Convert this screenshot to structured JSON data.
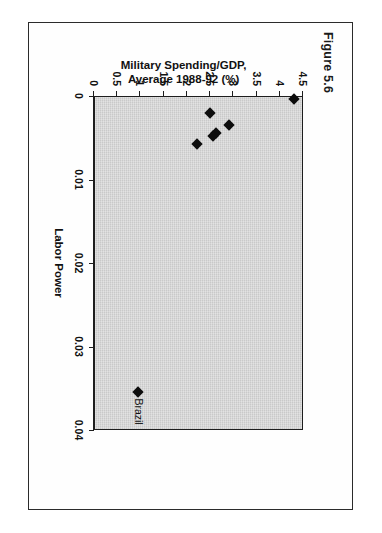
{
  "figure": {
    "caption": "Figure 5.6",
    "title": "South America"
  },
  "chart_data": {
    "type": "scatter",
    "title": "South America",
    "xlabel": "Labor Power",
    "ylabel": "Military Spending/GDP,\nAverage 1988-92 (%)",
    "ylabel_line1": "Military Spending/GDP,",
    "ylabel_line2": "Average 1988-92 (%)",
    "xlim": [
      0,
      0.04
    ],
    "ylim": [
      0,
      4.5
    ],
    "xticks": [
      0,
      0.01,
      0.02,
      0.03,
      0.04
    ],
    "xticklabels": [
      "0",
      "0.01",
      "0.02",
      "0.03",
      "0.04"
    ],
    "yticks": [
      0,
      0.5,
      1,
      1.5,
      2,
      2.5,
      3,
      3.5,
      4,
      4.5
    ],
    "yticklabels": [
      "0",
      "0.5",
      "1",
      "1.5",
      "2",
      "2.5",
      "3",
      "3.5",
      "4",
      "4.5"
    ],
    "grid": false,
    "legend": "none",
    "plot_background": "#c9c9c9",
    "marker_color": "#0d0d0d",
    "marker_shape": "diamond",
    "points": [
      {
        "label": "",
        "x": 0.0003,
        "y": 4.3
      },
      {
        "label": "",
        "x": 0.002,
        "y": 2.5
      },
      {
        "label": "",
        "x": 0.0035,
        "y": 2.9
      },
      {
        "label": "",
        "x": 0.0044,
        "y": 2.62
      },
      {
        "label": "",
        "x": 0.0048,
        "y": 2.56
      },
      {
        "label": "",
        "x": 0.0058,
        "y": 2.22
      },
      {
        "label": "Brazil",
        "x": 0.0355,
        "y": 0.95
      }
    ]
  }
}
